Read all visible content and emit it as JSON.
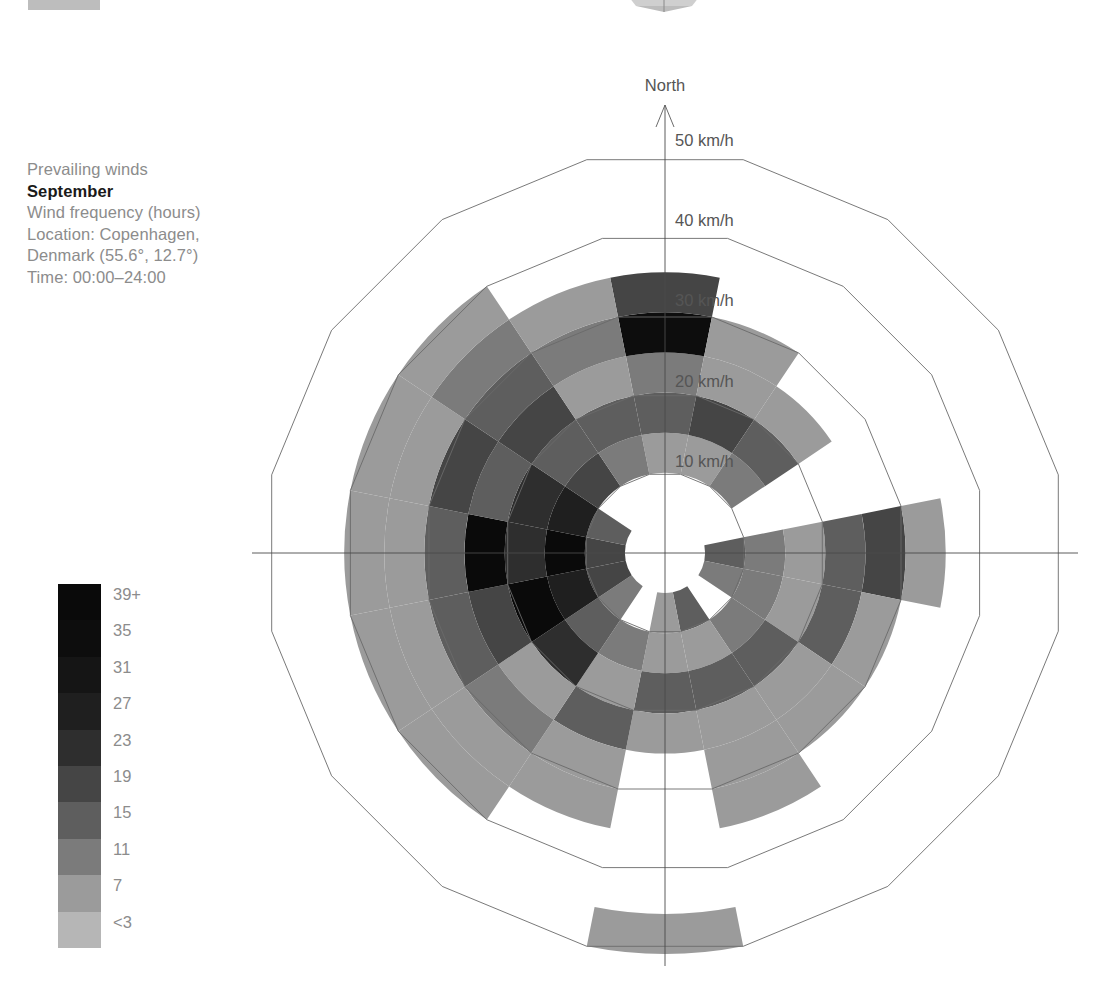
{
  "caption": {
    "line1": "Prevailing winds",
    "month": "September",
    "line3": "Wind frequency (hours)",
    "line4": "Location: Copenhagen,",
    "line5": "Denmark (55.6°, 12.7°)",
    "line6": "Time: 00:00–24:00"
  },
  "legend": {
    "title": "Wind frequency (hours)",
    "labels": [
      "39+",
      "35",
      "31",
      "27",
      "23",
      "19",
      "15",
      "11",
      "7",
      "<3"
    ],
    "colors": [
      "#0a0a0a",
      "#0d0d0d",
      "#151515",
      "#1f1f1f",
      "#2e2e2e",
      "#454545",
      "#5e5e5e",
      "#7b7b7b",
      "#9b9b9b",
      "#b6b6b6"
    ]
  },
  "chart_data": {
    "type": "polar",
    "subtitle": "Wind frequency (hours)",
    "orientation_label": "North",
    "radial_axis": {
      "label": "km/h",
      "tick_labels": [
        "10 km/h",
        "20 km/h",
        "30 km/h",
        "40 km/h",
        "50 km/h"
      ],
      "tick_values": [
        10,
        20,
        30,
        40,
        50
      ],
      "range": [
        0,
        50
      ],
      "units": "km/h"
    },
    "value_axis": {
      "label": "Wind frequency (hours)",
      "bins": [
        3,
        7,
        11,
        15,
        19,
        23,
        27,
        31,
        35,
        39
      ],
      "bin_labels": [
        "<3",
        "7",
        "11",
        "15",
        "19",
        "23",
        "27",
        "31",
        "35",
        "39+"
      ]
    },
    "sector_count": 16,
    "sector_width_deg": 22.5,
    "speed_band_edges": [
      5,
      10,
      15,
      20,
      25,
      30,
      35,
      40,
      45,
      50
    ],
    "directions": [
      "N",
      "NNE",
      "NE",
      "ENE",
      "E",
      "ESE",
      "SE",
      "SSE",
      "S",
      "SSW",
      "SW",
      "WSW",
      "W",
      "WNW",
      "NW",
      "NNW"
    ],
    "note": "Each cell is a direction x speed-band; value = wind frequency in hours (null = no data / blank).",
    "cells": [
      {
        "dir": "N",
        "bands": [
          null,
          9,
          17,
          11,
          37,
          22,
          null,
          null,
          null
        ]
      },
      {
        "dir": "NNE",
        "bands": [
          null,
          9,
          20,
          9,
          9,
          null,
          null,
          null,
          null
        ]
      },
      {
        "dir": "NE",
        "bands": [
          null,
          13,
          17,
          9,
          null,
          null,
          null,
          null,
          null
        ]
      },
      {
        "dir": "ENE",
        "bands": [
          null,
          null,
          null,
          null,
          null,
          null,
          null,
          null,
          null
        ]
      },
      {
        "dir": "E",
        "bands": [
          15,
          13,
          9,
          16,
          20,
          9,
          null,
          null,
          null
        ]
      },
      {
        "dir": "ESE",
        "bands": [
          13,
          13,
          9,
          18,
          9,
          null,
          null,
          null,
          null
        ]
      },
      {
        "dir": "SE",
        "bands": [
          null,
          13,
          17,
          9,
          9,
          null,
          null,
          null,
          null
        ]
      },
      {
        "dir": "SSE",
        "bands": [
          15,
          9,
          18,
          9,
          9,
          9,
          null,
          null,
          null
        ]
      },
      {
        "dir": "S",
        "bands": [
          9,
          9,
          17,
          9,
          null,
          null,
          null,
          null,
          9
        ]
      },
      {
        "dir": "SSW",
        "bands": [
          null,
          13,
          9,
          18,
          9,
          9,
          null,
          null,
          null
        ]
      },
      {
        "dir": "SW",
        "bands": [
          13,
          17,
          26,
          9,
          13,
          9,
          9,
          null,
          null
        ]
      },
      {
        "dir": "WSW",
        "bands": [
          20,
          28,
          39,
          22,
          17,
          9,
          9,
          null,
          null
        ]
      },
      {
        "dir": "W",
        "bands": [
          22,
          39,
          24,
          39,
          18,
          9,
          9,
          null,
          null
        ]
      },
      {
        "dir": "WNW",
        "bands": [
          17,
          30,
          26,
          17,
          22,
          9,
          9,
          null,
          null
        ]
      },
      {
        "dir": "NW",
        "bands": [
          null,
          22,
          17,
          20,
          16,
          13,
          9,
          null,
          null
        ]
      },
      {
        "dir": "NNW",
        "bands": [
          null,
          13,
          17,
          9,
          13,
          9,
          null,
          null,
          null
        ]
      }
    ]
  },
  "geometry": {
    "center_x": 665,
    "center_y": 553,
    "ring_step_px": 80.2,
    "inner_hole_px": 55
  }
}
